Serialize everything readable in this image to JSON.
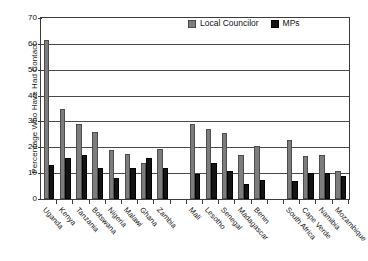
{
  "chart_data": {
    "type": "bar",
    "title": "",
    "xlabel": "",
    "ylabel": "Percentage Who Have Had Contact",
    "ylim": [
      0,
      70
    ],
    "ytick_step": 10,
    "yticks": [
      70,
      60,
      50,
      40,
      30,
      20,
      10,
      0
    ],
    "grid": true,
    "legend_position": "top-center",
    "categories": [
      "Uganda",
      "Kenya",
      "Tanzania",
      "Botswana",
      "Nigeria",
      "Malawi",
      "Ghana",
      "Zambia",
      "",
      "Mali",
      "Lesotho",
      "Senegal",
      "Madagascar",
      "Benin",
      "",
      "South Africa",
      "Cape Verde",
      "Namibia",
      "Mozambique"
    ],
    "series": [
      {
        "name": "Local Councilor",
        "color": "#7d7d7d",
        "values": [
          61.5,
          35,
          29,
          26,
          19,
          17.5,
          14,
          19.5,
          null,
          29,
          27,
          25.5,
          17,
          20.5,
          null,
          23,
          16.5,
          17,
          11
        ]
      },
      {
        "name": "MPs",
        "color": "#131313",
        "values": [
          13,
          16,
          17,
          12,
          8,
          12,
          16,
          12,
          null,
          9.5,
          14,
          11,
          6,
          7.5,
          null,
          7,
          10,
          10,
          9
        ]
      }
    ]
  },
  "legend": {
    "items": [
      {
        "label": "Local Councilor",
        "swatch": "councilor"
      },
      {
        "label": "MPs",
        "swatch": "mps"
      }
    ]
  }
}
